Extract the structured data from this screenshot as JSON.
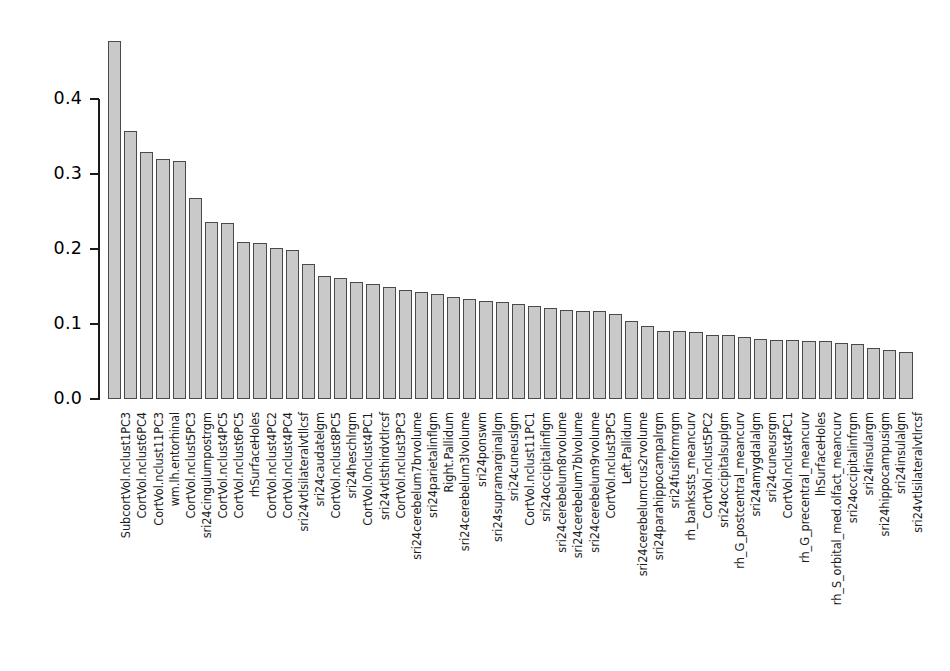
{
  "chart_data": {
    "type": "bar",
    "title": "",
    "subtitle": "",
    "xlabel": "",
    "ylabel": "",
    "ylim": [
      0.0,
      0.48
    ],
    "grid": false,
    "legend": null,
    "ytick_labels": [
      "0.4",
      "0.3",
      "0.2",
      "0.1",
      "0.0"
    ],
    "ytick_values": [
      0.4,
      0.3,
      0.2,
      0.1,
      0.0
    ],
    "bar_fill_color": "#c9c9c9",
    "bar_border_color": "#4a4a4a",
    "axis_color": "#1a1a1a",
    "categories": [
      "SubcortVol.nclust1PC3",
      "CortVol.nclust6PC4",
      "CortVol.nclust11PC3",
      "wm.lh.entorhinal",
      "CortVol.nclust5PC3",
      "sri24cingulumpostrgm",
      "CortVol.nclust4PC5",
      "CortVol.nclust6PC5",
      "rhSurfaceHoles",
      "CortVol.nclust4PC2",
      "CortVol.nclust4PC4",
      "sri24vtlsilateralvtllcsf",
      "sri24caudatelgm",
      "CortVol.nclust8PC5",
      "sri24heschlrgm",
      "CortVol.0nclust4PC1",
      "sri24vtlsthirdvtlrcsf",
      "CortVol.nclust3PC3",
      "sri24cerebelum7brvolume",
      "sri24parietalinflgm",
      "Right.Pallidum",
      "sri24cerebelum3lvolume",
      "sri24ponswm",
      "sri24supramarginallgm",
      "sri24cuneuslgm",
      "CortVol.nclust11PC1",
      "sri24occipitalinflgm",
      "sri24cerebelum8rvolume",
      "sri24cerebelum7blvolume",
      "sri24cerebelum9rvolume",
      "CortVol.nclust3PC5",
      "Left.Pallidum",
      "sri24cerebelumcrus2rvolume",
      "sri24parahippocampalrgm",
      "sri24fusiformrgm",
      "rh_bankssts_meancurv",
      "CortVol.nclust5PC2",
      "sri24occipitalsuplgm",
      "rh_G_postcentral_meancurv",
      "sri24amygdalalgm",
      "sri24cuneusrgm",
      "CortVol.nclust4PC1",
      "rh_G_precentral_meancurv",
      "lhSurfaceHoles",
      "rh_S_orbital_med.olfact_meancurv",
      "sri24occipitalinfrgm",
      "sri24insulargm",
      "sri24hippocampusigm",
      "sri24insulalgm",
      "sri24vtlsilateralvtlrcsf"
    ],
    "values": [
      0.477,
      0.357,
      0.33,
      0.32,
      0.318,
      0.268,
      0.236,
      0.235,
      0.209,
      0.208,
      0.201,
      0.199,
      0.18,
      0.164,
      0.162,
      0.156,
      0.153,
      0.149,
      0.145,
      0.143,
      0.14,
      0.136,
      0.133,
      0.131,
      0.129,
      0.127,
      0.124,
      0.122,
      0.119,
      0.118,
      0.117,
      0.114,
      0.104,
      0.098,
      0.091,
      0.091,
      0.09,
      0.086,
      0.085,
      0.083,
      0.08,
      0.079,
      0.079,
      0.078,
      0.077,
      0.075,
      0.073,
      0.068,
      0.066,
      0.063
    ]
  },
  "geometry": {
    "plot_left": 108,
    "plot_baseline_y": 399,
    "bar_pitch": 16.15,
    "bar_width": 13.2,
    "y_per_unit": 750,
    "axis_x": 99,
    "label_top": 412
  }
}
